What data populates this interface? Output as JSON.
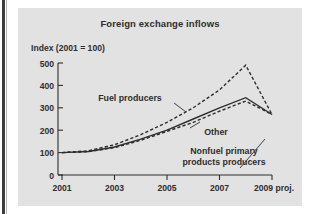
{
  "figure": {
    "title": "Foreign exchange inflows",
    "y_axis_caption": "Index (2001 = 100)",
    "panel_color": "#e2e2e2",
    "ink_color": "#2e2e2e"
  },
  "chart_data": {
    "type": "line",
    "title": "Foreign exchange inflows",
    "subtitle": "",
    "xlabel": "",
    "ylabel": "Index (2001 = 100)",
    "x": [
      2001,
      2002,
      2003,
      2004,
      2005,
      2006,
      2007,
      2008,
      2009
    ],
    "xtick_labels": [
      "2001",
      "2003",
      "2005",
      "2007",
      "2009 proj."
    ],
    "xticks": [
      2001,
      2003,
      2005,
      2007,
      2009
    ],
    "ytick_labels": [
      "0",
      "100",
      "200",
      "300",
      "400",
      "500"
    ],
    "yticks": [
      0,
      100,
      200,
      300,
      400,
      500
    ],
    "ylim": [
      0,
      500
    ],
    "xlim": [
      2001,
      2009
    ],
    "grid": false,
    "legend": "inline-annotations",
    "series": [
      {
        "name": "Fuel producers",
        "style": "dashed",
        "values": [
          100,
          108,
          135,
          180,
          235,
          300,
          380,
          490,
          270
        ]
      },
      {
        "name": "Other",
        "style": "solid",
        "values": [
          100,
          105,
          125,
          160,
          200,
          250,
          300,
          345,
          270
        ]
      },
      {
        "name": "Nonfuel primary products producers",
        "style": "dashed",
        "values": [
          100,
          104,
          122,
          155,
          195,
          235,
          285,
          330,
          270
        ]
      }
    ],
    "annotations": [
      {
        "text": "Fuel producers",
        "series": "Fuel producers"
      },
      {
        "text": "Other",
        "series": "Other"
      },
      {
        "text": "Nonfuel primary",
        "series": "Nonfuel primary products producers"
      },
      {
        "text": "products producers",
        "series": "Nonfuel primary products producers"
      }
    ]
  }
}
